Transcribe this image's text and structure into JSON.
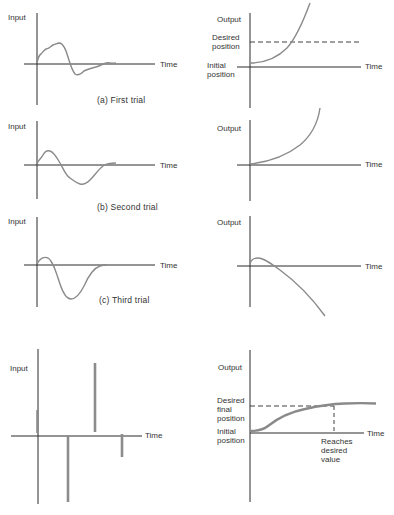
{
  "panels": {
    "first": {
      "caption": "(a)  First trial",
      "input": {
        "ylabel": "Input",
        "xlabel": "Time"
      },
      "output": {
        "ylabel": "Output",
        "xlabel": "Time",
        "desired": "Desired\nposition",
        "initial": "Initial\nposition"
      }
    },
    "second": {
      "caption": "(b)  Second trial",
      "input": {
        "ylabel": "Input",
        "xlabel": "Time"
      },
      "output": {
        "ylabel": "Output",
        "xlabel": "Time"
      }
    },
    "third": {
      "caption": "(c)  Third trial",
      "input": {
        "ylabel": "Input",
        "xlabel": "Time"
      },
      "output": {
        "ylabel": "Output",
        "xlabel": "Time"
      }
    },
    "final": {
      "input": {
        "ylabel": "Input",
        "xlabel": "Time"
      },
      "output": {
        "ylabel": "Output",
        "xlabel": "Time",
        "desired_line1": "Desired",
        "desired_line2": "final",
        "desired_line3": "position",
        "initial_line1": "Initial",
        "initial_line2": "position",
        "reaches_line1": "Reaches",
        "reaches_line2": "desired",
        "reaches_line3": "value"
      }
    }
  },
  "labels": {
    "first_desired_1": "Desired",
    "first_desired_2": "position",
    "first_initial_1": "Initial",
    "first_initial_2": "position"
  },
  "colors": {
    "axis": "#2a2a2a",
    "curve": "#8a8a8a",
    "impulse": "#8c8c8c"
  }
}
